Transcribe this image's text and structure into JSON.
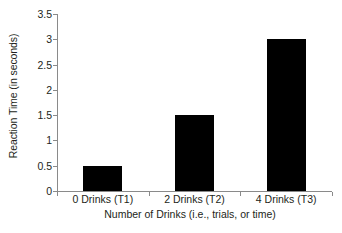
{
  "chart_data": {
    "type": "bar",
    "title": "",
    "categories": [
      "0 Drinks (T1)",
      "2 Drinks (T2)",
      "4 Drinks (T3)"
    ],
    "values": [
      0.5,
      1.5,
      3.0
    ],
    "xlabel": "Number of Drinks (i.e., trials, or time)",
    "ylabel": "Reaction Time (in seconds)",
    "ylim": [
      0,
      3.5
    ],
    "yticks": [
      0,
      0.5,
      1,
      1.5,
      2,
      2.5,
      3,
      3.5
    ],
    "ytick_labels": [
      "0",
      "0.5",
      "1",
      "1.5",
      "2",
      "2.5",
      "3",
      "3.5"
    ],
    "grid": false,
    "legend": false,
    "bar_color": "#000000",
    "axis_color": "#8a8a8a",
    "background": "#ffffff"
  }
}
